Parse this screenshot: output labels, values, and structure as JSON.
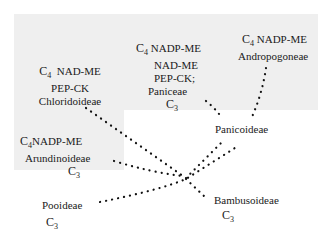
{
  "diagram": {
    "type": "phylogeny-dotted-tree",
    "colors": {
      "shade": "#efefef",
      "text": "#1a1a1a",
      "dots": "#111111"
    },
    "nodes": {
      "chloridoideae": {
        "pathway_prefix": "C",
        "pathway_sub": "4",
        "pathway": "NAD-ME",
        "line2": "PEP-CK",
        "name": "Chloridoideae"
      },
      "paniceae": {
        "pathway_prefix": "C",
        "pathway_sub": "4",
        "pathway": "NADP-ME",
        "line2": "NAD-ME",
        "line3": "PEP-CK;",
        "name": "Paniceae",
        "c3_prefix": "C",
        "c3_sub": "3"
      },
      "andropogoneae": {
        "pathway_prefix": "C",
        "pathway_sub": "4",
        "pathway": "NADP-ME",
        "name": "Andropogoneae"
      },
      "panicoideae": {
        "name": "Panicoideae"
      },
      "arundinoideae": {
        "pathway_prefix": "C",
        "pathway_sub": "4",
        "pathway": "NADP-ME",
        "name": "Arundinoideae",
        "c3_prefix": "C",
        "c3_sub": "3"
      },
      "pooideae": {
        "name": "Pooideae",
        "c3_prefix": "C",
        "c3_sub": "3"
      },
      "bambusoideae": {
        "name": "Bambusoideae",
        "c3_prefix": "C",
        "c3_sub": "3"
      }
    }
  }
}
